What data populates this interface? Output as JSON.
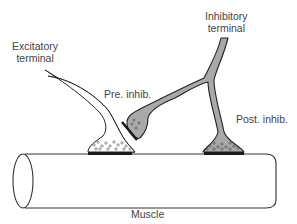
{
  "labels": {
    "excitatory_terminal": [
      "Excitatory",
      "terminal"
    ],
    "inhibitory_terminal": [
      "Inhibitory",
      "terminal"
    ],
    "pre_inhib": "Pre. inhib.",
    "post_inhib": "Post. inhib.",
    "muscle": "Muscle"
  },
  "colors": {
    "stroke": "#222222",
    "inhibitory_fill": "#a9a9a9",
    "excitatory_fill": "#ffffff",
    "synapse_bar": "#1a1a1a",
    "label": "#444444"
  }
}
